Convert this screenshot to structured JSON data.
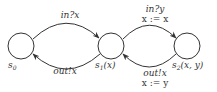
{
  "diagram": {
    "type": "state-machine",
    "colors": {
      "stroke": "#333333",
      "background": "#ffffff"
    },
    "nodes": [
      {
        "id": "s0",
        "base": "s",
        "sub": "0",
        "args": "",
        "cx": 21,
        "cy": 46,
        "r": 13
      },
      {
        "id": "s1",
        "base": "s",
        "sub": "1",
        "args": "(x)",
        "cx": 111,
        "cy": 46,
        "r": 13
      },
      {
        "id": "s2",
        "base": "s",
        "sub": "2",
        "args": "(x, y)",
        "cx": 187,
        "cy": 46,
        "r": 13
      }
    ],
    "edges": [
      {
        "from": "s0",
        "to": "s1",
        "label_lines": [
          "in?x"
        ]
      },
      {
        "from": "s1",
        "to": "s0",
        "label_lines": [
          "out!x"
        ]
      },
      {
        "from": "s1",
        "to": "s2",
        "label_lines": [
          "in?y",
          "x := x"
        ]
      },
      {
        "from": "s2",
        "to": "s1",
        "label_lines": [
          "out!x",
          "x := y"
        ]
      }
    ],
    "labels": {
      "s0_base": "s",
      "s0_sub": "0",
      "s1_base": "s",
      "s1_sub": "1",
      "s1_args": "(x)",
      "s2_base": "s",
      "s2_sub": "2",
      "s2_args": "(x, y)",
      "e01_guard": "in?x",
      "e10_guard": "out!x",
      "e12_guard": "in?y",
      "e12_assign": "x := x",
      "e21_guard": "out!x",
      "e21_assign": "x := y"
    }
  }
}
